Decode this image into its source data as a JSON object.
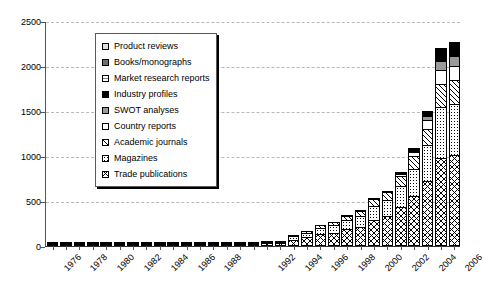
{
  "chart_data": {
    "type": "bar",
    "subtype": "stacked-bar",
    "title": "",
    "subtitle": "",
    "xlabel": "",
    "ylabel": "",
    "ylim": [
      0,
      2500
    ],
    "y_ticks": [
      0,
      500,
      1000,
      1500,
      2000,
      2500
    ],
    "grid": true,
    "legend_position": "upper-left-inside",
    "x": [
      1976,
      1977,
      1978,
      1979,
      1980,
      1981,
      1982,
      1983,
      1984,
      1985,
      1986,
      1987,
      1988,
      1989,
      1990,
      1991,
      1992,
      1993,
      1994,
      1995,
      1996,
      1997,
      1998,
      1999,
      2000,
      2001,
      2002,
      2003,
      2004,
      2005,
      2006
    ],
    "x_tick_labels": [
      "1976",
      "",
      "1978",
      "",
      "1980",
      "",
      "1982",
      "",
      "1984",
      "",
      "1986",
      "",
      "1988",
      "",
      "",
      "",
      "1992",
      "",
      "1994",
      "",
      "1996",
      "",
      "1998",
      "",
      "2000",
      "",
      "2002",
      "",
      "2004",
      "",
      "2006"
    ],
    "categories": [
      "1976",
      "1977",
      "1978",
      "1979",
      "1980",
      "1981",
      "1982",
      "1983",
      "1984",
      "1985",
      "1986",
      "1987",
      "1988",
      "1989",
      "1990",
      "1991",
      "1992",
      "1993",
      "1994",
      "1995",
      "1996",
      "1997",
      "1998",
      "1999",
      "2000",
      "2001",
      "2002",
      "2003",
      "2004",
      "2005",
      "2006"
    ],
    "series": [
      {
        "name": "Trade publications",
        "pattern": "cross-hatch",
        "values": [
          8,
          6,
          7,
          6,
          8,
          7,
          9,
          10,
          14,
          12,
          15,
          14,
          16,
          15,
          18,
          20,
          30,
          28,
          70,
          95,
          130,
          150,
          185,
          215,
          290,
          330,
          430,
          560,
          720,
          980,
          1010
        ]
      },
      {
        "name": "Magazines",
        "pattern": "stipple-dots",
        "values": [
          4,
          3,
          4,
          3,
          4,
          4,
          5,
          5,
          7,
          6,
          8,
          7,
          8,
          8,
          9,
          10,
          16,
          15,
          40,
          50,
          70,
          80,
          100,
          115,
          160,
          180,
          240,
          300,
          400,
          560,
          570
        ]
      },
      {
        "name": "Academic journals",
        "pattern": "diagonal-hatch",
        "values": [
          2,
          2,
          2,
          2,
          2,
          2,
          3,
          3,
          4,
          3,
          4,
          4,
          5,
          4,
          5,
          6,
          8,
          8,
          18,
          22,
          32,
          38,
          46,
          54,
          75,
          85,
          110,
          140,
          185,
          255,
          260
        ]
      },
      {
        "name": "Country reports",
        "pattern": "solid-white",
        "values": [
          0,
          0,
          0,
          0,
          0,
          0,
          0,
          0,
          0,
          0,
          0,
          0,
          0,
          0,
          0,
          0,
          0,
          0,
          0,
          0,
          0,
          0,
          8,
          10,
          14,
          18,
          26,
          40,
          90,
          160,
          165
        ]
      },
      {
        "name": "SWOT analyses",
        "pattern": "grey-stipple",
        "values": [
          0,
          0,
          0,
          0,
          0,
          0,
          0,
          0,
          0,
          0,
          0,
          0,
          0,
          0,
          0,
          0,
          0,
          0,
          0,
          0,
          0,
          0,
          0,
          0,
          0,
          0,
          0,
          15,
          45,
          105,
          110
        ]
      },
      {
        "name": "Industry profiles",
        "pattern": "solid-black",
        "values": [
          0,
          0,
          0,
          0,
          0,
          0,
          0,
          0,
          0,
          0,
          0,
          0,
          0,
          0,
          0,
          0,
          0,
          0,
          0,
          0,
          0,
          0,
          0,
          0,
          0,
          0,
          20,
          35,
          60,
          110,
          115
        ]
      },
      {
        "name": "Market research reports",
        "pattern": "light-dotted",
        "values": [
          0,
          0,
          0,
          0,
          0,
          0,
          0,
          0,
          0,
          0,
          0,
          0,
          0,
          0,
          0,
          0,
          0,
          0,
          0,
          0,
          0,
          0,
          0,
          0,
          0,
          0,
          0,
          0,
          0,
          8,
          10
        ]
      },
      {
        "name": "Books/monographs",
        "pattern": "dark-grey",
        "values": [
          0,
          0,
          0,
          0,
          0,
          0,
          0,
          0,
          0,
          0,
          0,
          0,
          0,
          0,
          0,
          0,
          0,
          0,
          0,
          0,
          0,
          0,
          0,
          0,
          0,
          0,
          0,
          0,
          0,
          5,
          6
        ]
      },
      {
        "name": "Product reviews",
        "pattern": "light-grey",
        "values": [
          0,
          0,
          0,
          0,
          0,
          0,
          0,
          0,
          0,
          0,
          0,
          0,
          0,
          0,
          0,
          0,
          0,
          0,
          0,
          0,
          0,
          0,
          0,
          0,
          0,
          0,
          0,
          0,
          0,
          4,
          5
        ]
      }
    ]
  },
  "legend": {
    "items": [
      {
        "label": "Product reviews",
        "swatch": "pat-product"
      },
      {
        "label": "Books/monographs",
        "swatch": "pat-books"
      },
      {
        "label": "Market research reports",
        "swatch": "pat-market"
      },
      {
        "label": "Industry profiles",
        "swatch": "pat-industry"
      },
      {
        "label": "SWOT analyses",
        "swatch": "pat-swot"
      },
      {
        "label": "Country reports",
        "swatch": "pat-country"
      },
      {
        "label": "Academic journals",
        "swatch": "pat-academic"
      },
      {
        "label": "Magazines",
        "swatch": "pat-magazines"
      },
      {
        "label": "Trade publications",
        "swatch": "pat-trade"
      }
    ]
  },
  "colors": {
    "axis": "#333333",
    "gridline": "#b9b9b9",
    "text": "#000000",
    "plot_background": "#ffffff"
  }
}
